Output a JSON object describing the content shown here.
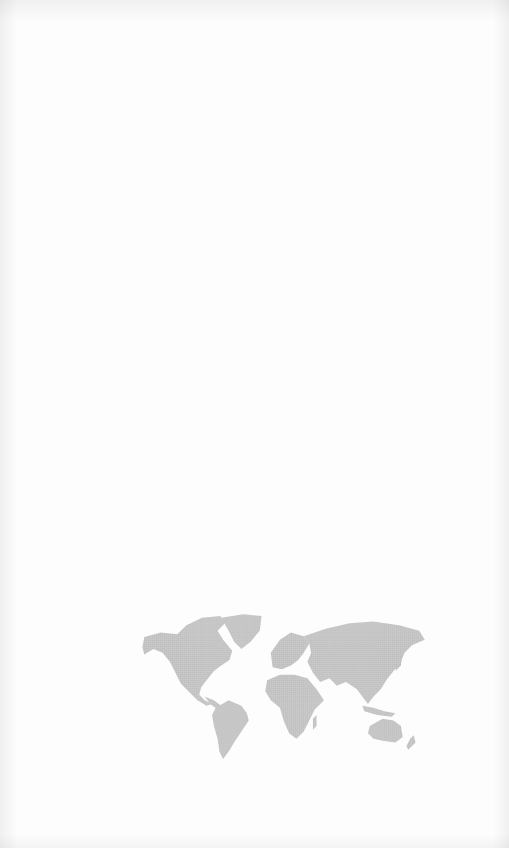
{
  "page": {
    "background_color": "#fdfdfd",
    "vignette": true
  },
  "world_map": {
    "style": "dotted",
    "fill_color": "#c4c4c4",
    "regions": [
      "north-america",
      "greenland",
      "south-america",
      "europe",
      "africa",
      "asia",
      "australia",
      "new-zealand"
    ]
  }
}
